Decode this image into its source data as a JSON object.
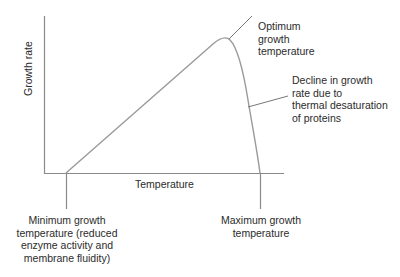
{
  "diagram": {
    "axes": {
      "y_label": "Growth rate",
      "x_label": "Temperature"
    },
    "annotations": {
      "optimum": "Optimum\ngrowth\ntemperature",
      "decline": "Decline in growth\nrate due to\nthermal desaturation\nof proteins",
      "minimum": "Minimum growth\ntemperature (reduced\nenzyme activity and\nmembrane fluidity)",
      "maximum": "Maximum growth\ntemperature"
    },
    "colors": {
      "axis": "#8a8a8a",
      "curve": "#9a9a9a",
      "text": "#2b2b2b"
    }
  }
}
